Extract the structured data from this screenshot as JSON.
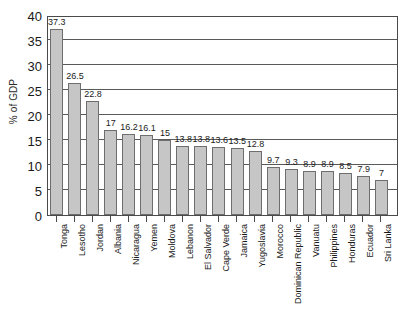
{
  "chart_data": {
    "type": "bar",
    "title": "",
    "subtitle": "",
    "xlabel": "",
    "ylabel": "% of GDP",
    "ylim": [
      0,
      40
    ],
    "ytick_step": 5,
    "yticks": [
      0,
      5,
      10,
      15,
      20,
      25,
      30,
      35,
      40
    ],
    "ytick_labels": [
      "0",
      "5",
      "10",
      "15",
      "20",
      "25",
      "30",
      "35",
      "40"
    ],
    "grid": true,
    "grid_axis": "y",
    "legend": false,
    "legend_position": "none",
    "data_labels": true,
    "orientation": "vertical",
    "bar_color": "#c6c6c6",
    "bar_edge_color": "#6e6e6e",
    "axis_color": "#4a4a4a",
    "background_color": "#ffffff",
    "categories": [
      "Tonga",
      "Lesotho",
      "Jordan",
      "Albania",
      "Nicaragua",
      "Yemen",
      "Moldova",
      "Lebanon",
      "El Salvador",
      "Cape Verde",
      "Jamaica",
      "Yugoslavia",
      "Morocco",
      "Dominican Republic",
      "Vanuatu",
      "Philippines",
      "Honduras",
      "Ecuador",
      "Sri Lanka"
    ],
    "values": [
      37.3,
      26.5,
      22.8,
      17,
      16.2,
      16.1,
      15,
      13.8,
      13.8,
      13.6,
      13.5,
      12.8,
      9.7,
      9.3,
      8.9,
      8.9,
      8.5,
      7.9,
      7
    ],
    "value_labels": [
      "37.3",
      "26.5",
      "22.8",
      "17",
      "16.2",
      "16.1",
      "15",
      "13.8",
      "13.8",
      "13.6",
      "13.5",
      "12.8",
      "9.7",
      "9.3",
      "8.9",
      "8.9",
      "8.5",
      "7.9",
      "7"
    ]
  }
}
